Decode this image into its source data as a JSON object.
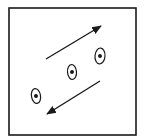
{
  "diagram": {
    "type": "cell-migration-schematic",
    "colors": {
      "ink": "#1a1a1a",
      "background": "#ffffff"
    },
    "frame": {
      "x": 9,
      "y": 8,
      "width": 127,
      "height": 127
    },
    "cells": [
      {
        "id": "cell-1",
        "cx": 36,
        "cy": 96,
        "rx": 4.5,
        "ry": 7.5,
        "rotate": -10
      },
      {
        "id": "cell-2",
        "cx": 72,
        "cy": 72,
        "rx": 4.5,
        "ry": 7.5,
        "rotate": -5
      },
      {
        "id": "cell-3",
        "cx": 100,
        "cy": 56,
        "rx": 5,
        "ry": 8,
        "rotate": 5
      }
    ],
    "arrows": [
      {
        "id": "arrow-up-right",
        "direction": "up-right",
        "x1": 46,
        "y1": 59,
        "x2": 101,
        "y2": 26
      },
      {
        "id": "arrow-down-left",
        "direction": "down-left",
        "x1": 100,
        "y1": 81,
        "x2": 47,
        "y2": 114
      }
    ]
  }
}
